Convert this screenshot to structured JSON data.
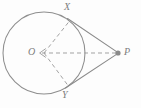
{
  "figure": {
    "kind": "geometry-diagram",
    "background_color": "#fdfdfd",
    "stroke_color": "#8a8a8a",
    "dash_color": "#9a9a9a",
    "label_color": "#7d7d7d",
    "labels": {
      "center": "O",
      "tangent_point_top": "X",
      "tangent_point_bottom": "Y",
      "external_point": "P"
    },
    "geometry": {
      "circle": {
        "cx": 44,
        "cy": 53,
        "r": 41
      },
      "points": {
        "O": {
          "x": 44,
          "y": 53
        },
        "X": {
          "x": 69.5,
          "y": 21.0
        },
        "Y": {
          "x": 68.0,
          "y": 85.5
        },
        "P": {
          "x": 118,
          "y": 53
        }
      },
      "solid_segments": [
        {
          "name": "tangent-PX",
          "from": "X",
          "to": "P"
        },
        {
          "name": "tangent-PY",
          "from": "Y",
          "to": "P"
        }
      ],
      "dashed_segments": [
        {
          "name": "radius-OX",
          "from": "O",
          "to": "X"
        },
        {
          "name": "radius-OY",
          "from": "O",
          "to": "Y"
        },
        {
          "name": "segment-OP",
          "from": "P",
          "to": "O",
          "arrowhead_at": "O"
        }
      ],
      "marker": {
        "name": "point-P-dot",
        "at": "P",
        "radius": 2.6
      }
    }
  }
}
